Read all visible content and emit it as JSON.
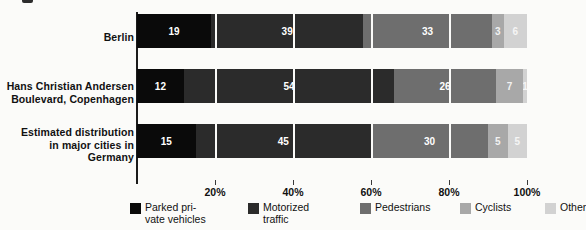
{
  "chart_data": {
    "type": "bar",
    "orientation": "horizontal",
    "stacked": true,
    "normalized_percent": true,
    "title": "",
    "subtitle": "",
    "xlabel": "",
    "ylabel": "",
    "xlim": [
      0,
      100
    ],
    "grid": true,
    "legend_position": "bottom",
    "categories": [
      "Berlin",
      "Hans Christian Andersen\nBoulevard, Copenhagen",
      "Estimated distribution\nin major cities in\nGermany"
    ],
    "xticks": [
      20,
      40,
      60,
      80,
      100
    ],
    "xticklabels": [
      "20%",
      "40%",
      "60%",
      "80%",
      "100%"
    ],
    "series": [
      {
        "name": "Parked pri-\nvate vehicles",
        "legend_label": "Parked pri-\nvate vehicles",
        "color": "#0a0a0a",
        "values": [
          19,
          12,
          15
        ],
        "labels": [
          "19",
          "12",
          "15"
        ]
      },
      {
        "name": "Motorized\ntraffic",
        "legend_label": "Motorized\ntraffic",
        "color": "#2b2b2b",
        "values": [
          39,
          54,
          45
        ],
        "labels": [
          "39",
          "54",
          "45"
        ]
      },
      {
        "name": "Pedestrians",
        "legend_label": "Pedestrians",
        "color": "#6e6e6e",
        "values": [
          33,
          26,
          30
        ],
        "labels": [
          "33",
          "26",
          "30"
        ]
      },
      {
        "name": "Cyclists",
        "legend_label": "Cyclists",
        "color": "#a8a8a8",
        "values": [
          3,
          7,
          5
        ],
        "labels": [
          "3",
          "7",
          "5"
        ]
      },
      {
        "name": "Other",
        "legend_label": "Other",
        "color": "#d2d2d2",
        "values": [
          6,
          1,
          5
        ],
        "labels": [
          "6",
          "1",
          "5"
        ]
      }
    ]
  },
  "axis": {
    "tick_labels": [
      "20%",
      "40%",
      "60%",
      "80%",
      "100%"
    ]
  },
  "row_labels": [
    "Berlin",
    "Hans Christian Andersen\nBoulevard, Copenhagen",
    "Estimated distribution\nin major cities in\nGermany"
  ],
  "legend": {
    "items": [
      {
        "label": "Parked pri-\nvate vehicles",
        "color": "#0a0a0a"
      },
      {
        "label": "Motorized\ntraffic",
        "color": "#2b2b2b"
      },
      {
        "label": "Pedestrians",
        "color": "#6e6e6e"
      },
      {
        "label": "Cyclists",
        "color": "#a8a8a8"
      },
      {
        "label": "Other",
        "color": "#d2d2d2"
      }
    ]
  },
  "colors": {
    "background": "#fbfbf9",
    "axis": "#1b1b1b",
    "text": "#111111",
    "gridline": "#fbfbf9",
    "bar_label_text": "#ffffff"
  }
}
